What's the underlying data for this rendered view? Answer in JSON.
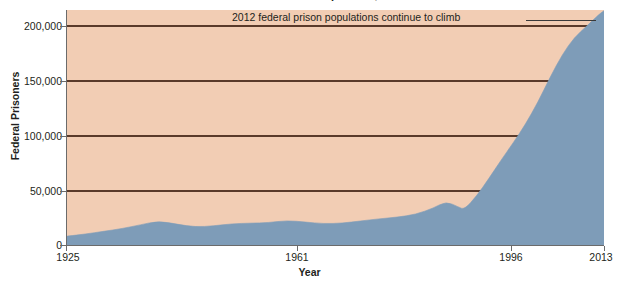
{
  "figure": {
    "title": "Federal Prison Population, 1925-2013",
    "title_cropped": true
  },
  "annotation": {
    "text": "2012 federal prison populations continue to climb",
    "leader_line": true
  },
  "axes": {
    "y_title": "Federal Prisoners",
    "x_title": "Year",
    "y_ticks": [
      "0",
      "50,000",
      "100,000",
      "150,000",
      "200,000"
    ],
    "x_ticks": [
      "1925",
      "1961",
      "1996",
      "2013"
    ]
  },
  "colors": {
    "plot_background": "#f2cdb4",
    "area_fill": "#7e9cb8",
    "gridline": "#5a3a2a",
    "axis": "#6b6b6b",
    "text": "#231f20",
    "page_background": "#ffffff"
  },
  "chart_data": {
    "type": "area",
    "title": "Federal Prison Population, 1925-2013",
    "xlabel": "Year",
    "ylabel": "Federal Prisoners",
    "xlim": [
      1925,
      2013
    ],
    "ylim": [
      0,
      217000
    ],
    "grid": true,
    "gridlines_y": [
      50000,
      100000,
      150000,
      200000
    ],
    "legend": "none",
    "x_tick_values": [
      1925,
      1961,
      1996,
      2013
    ],
    "y_tick_values": [
      0,
      50000,
      100000,
      150000,
      200000
    ],
    "annotations": [
      {
        "text": "2012 federal prison populations continue to climb",
        "x": 2012,
        "y": 217000
      }
    ],
    "series": [
      {
        "name": "Federal Prisoners",
        "fill_color": "#7e9cb8",
        "x": [
          1925,
          1928,
          1931,
          1934,
          1937,
          1940,
          1943,
          1946,
          1949,
          1952,
          1955,
          1958,
          1961,
          1964,
          1967,
          1970,
          1973,
          1976,
          1979,
          1982,
          1985,
          1987,
          1989,
          1990,
          1992,
          1994,
          1996,
          1998,
          2000,
          2002,
          2004,
          2006,
          2008,
          2010,
          2012,
          2013
        ],
        "values": [
          9000,
          11000,
          13500,
          16000,
          19500,
          23000,
          20000,
          17500,
          18500,
          20500,
          21000,
          21500,
          23500,
          22000,
          20500,
          21000,
          23000,
          25000,
          26500,
          29000,
          35000,
          41000,
          36000,
          33500,
          46000,
          62000,
          79000,
          95000,
          112000,
          132000,
          155000,
          176000,
          192000,
          202000,
          213000,
          217000
        ]
      }
    ]
  }
}
